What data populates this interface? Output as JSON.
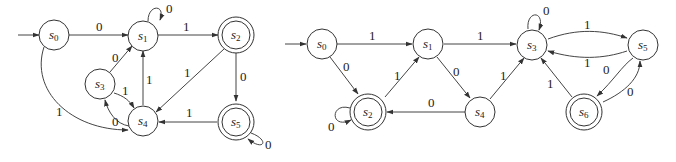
{
  "diagrams": [
    {
      "id": "left",
      "start_state": "s0",
      "states": [
        {
          "name": "s0",
          "label": "s",
          "sub": "0",
          "accepting": false
        },
        {
          "name": "s1",
          "label": "s",
          "sub": "1",
          "accepting": false
        },
        {
          "name": "s2",
          "label": "s",
          "sub": "2",
          "accepting": true
        },
        {
          "name": "s3",
          "label": "s",
          "sub": "3",
          "accepting": false
        },
        {
          "name": "s4",
          "label": "s",
          "sub": "4",
          "accepting": false
        },
        {
          "name": "s5",
          "label": "s",
          "sub": "5",
          "accepting": true
        }
      ],
      "transitions": [
        {
          "from": "s0",
          "to": "s1",
          "label": "0"
        },
        {
          "from": "s0",
          "to": "s4",
          "label": "1"
        },
        {
          "from": "s1",
          "to": "s1",
          "label": "0"
        },
        {
          "from": "s1",
          "to": "s2",
          "label": "1"
        },
        {
          "from": "s2",
          "to": "s4",
          "label": "1"
        },
        {
          "from": "s2",
          "to": "s5",
          "label": "0"
        },
        {
          "from": "s3",
          "to": "s1",
          "label": "0"
        },
        {
          "from": "s3",
          "to": "s4",
          "label": "1"
        },
        {
          "from": "s4",
          "to": "s3",
          "label": "0"
        },
        {
          "from": "s4",
          "to": "s1",
          "label": "1"
        },
        {
          "from": "s5",
          "to": "s4",
          "label": "1"
        },
        {
          "from": "s5",
          "to": "s5",
          "label": "0"
        }
      ]
    },
    {
      "id": "right",
      "start_state": "s0",
      "states": [
        {
          "name": "s0",
          "label": "s",
          "sub": "0",
          "accepting": false
        },
        {
          "name": "s1",
          "label": "s",
          "sub": "1",
          "accepting": false
        },
        {
          "name": "s2",
          "label": "s",
          "sub": "2",
          "accepting": true
        },
        {
          "name": "s3",
          "label": "s",
          "sub": "3",
          "accepting": false
        },
        {
          "name": "s4",
          "label": "s",
          "sub": "4",
          "accepting": false
        },
        {
          "name": "s5",
          "label": "s",
          "sub": "5",
          "accepting": false
        },
        {
          "name": "s6",
          "label": "s",
          "sub": "6",
          "accepting": true
        }
      ],
      "transitions": [
        {
          "from": "s0",
          "to": "s1",
          "label": "1"
        },
        {
          "from": "s0",
          "to": "s2",
          "label": "0"
        },
        {
          "from": "s1",
          "to": "s3",
          "label": "1"
        },
        {
          "from": "s1",
          "to": "s4",
          "label": "0"
        },
        {
          "from": "s2",
          "to": "s1",
          "label": "1"
        },
        {
          "from": "s2",
          "to": "s2",
          "label": "0"
        },
        {
          "from": "s3",
          "to": "s3",
          "label": "0"
        },
        {
          "from": "s3",
          "to": "s5",
          "label": "1"
        },
        {
          "from": "s4",
          "to": "s2",
          "label": "0"
        },
        {
          "from": "s4",
          "to": "s3",
          "label": "1"
        },
        {
          "from": "s5",
          "to": "s3",
          "label": "1"
        },
        {
          "from": "s5",
          "to": "s6",
          "label": "0"
        },
        {
          "from": "s6",
          "to": "s3",
          "label": "1"
        },
        {
          "from": "s6",
          "to": "s5",
          "label": "0"
        }
      ]
    }
  ]
}
